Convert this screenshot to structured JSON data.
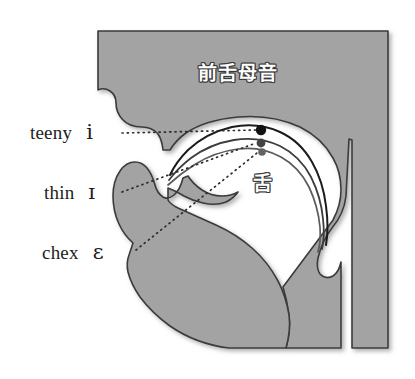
{
  "figure": {
    "kind": "sagittal-vocal-tract-diagram",
    "background_color": "#ffffff",
    "head_fill_color": "#a3a3a3",
    "head_outline_color": "#3b3b3b",
    "cavity_color": "#ffffff"
  },
  "annotations": {
    "front_vowels": "前舌母音",
    "tongue": "舌"
  },
  "vowels": [
    {
      "word": "teeny",
      "ipa": "i",
      "dot_color": "#131313",
      "curve_color": "#1b1b1b",
      "dot": {
        "x": 261,
        "y": 130
      },
      "leader_from": {
        "x": 122,
        "y": 133
      }
    },
    {
      "word": "thin",
      "ipa": "ɪ",
      "dot_color": "#434343",
      "curve_color": "#3c3c3c",
      "dot": {
        "x": 261,
        "y": 143
      },
      "leader_from": {
        "x": 122,
        "y": 192
      }
    },
    {
      "word": "chex",
      "ipa": "ɛ",
      "dot_color": "#636363",
      "curve_color": "#5a5a5a",
      "dot": {
        "x": 262,
        "y": 152
      },
      "leader_from": {
        "x": 136,
        "y": 250
      }
    }
  ]
}
